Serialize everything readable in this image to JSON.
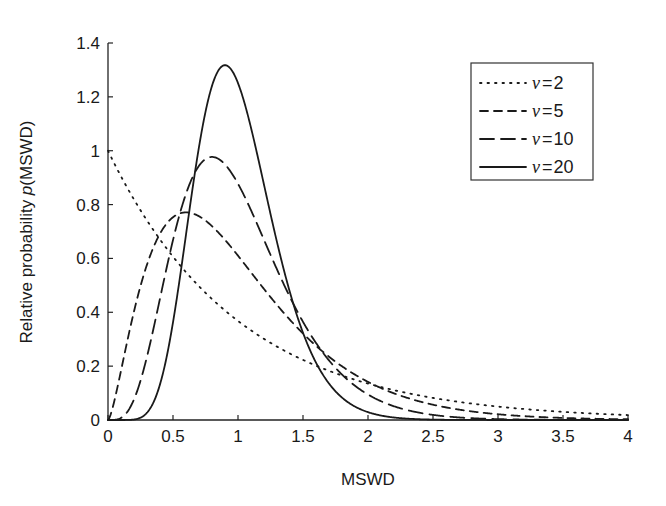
{
  "chart_data": {
    "type": "line",
    "title": "",
    "xlabel": "MSWD",
    "ylabel": "Relative probability p(MSWD)",
    "ylabel_parts": {
      "prefix": "Relative probability ",
      "italic": "p",
      "suffix": "(MSWD)"
    },
    "xlim": [
      0,
      4
    ],
    "ylim": [
      0,
      1.4
    ],
    "xticks": [
      "0",
      "0.5",
      "1",
      "1.5",
      "2",
      "2.5",
      "3",
      "3.5",
      "4"
    ],
    "yticks": [
      "0",
      "0.2",
      "0.4",
      "0.6",
      "0.8",
      "1",
      "1.2",
      "1.4"
    ],
    "grid": false,
    "legend_position": "upper right",
    "series": [
      {
        "name": "ν = 2",
        "nu": 2,
        "style": "dotted",
        "peak": {
          "x": 0.0,
          "y": 1.0
        }
      },
      {
        "name": "ν = 5",
        "nu": 5,
        "style": "dashed-short",
        "peak": {
          "x": 0.6,
          "y": 0.77
        }
      },
      {
        "name": "ν = 10",
        "nu": 10,
        "style": "dashed-long",
        "peak": {
          "x": 0.8,
          "y": 0.98
        }
      },
      {
        "name": "ν = 20",
        "nu": 20,
        "style": "solid",
        "peak": {
          "x": 0.9,
          "y": 1.32
        }
      }
    ],
    "sampled_values": {
      "x": [
        0,
        0.25,
        0.5,
        0.75,
        1.0,
        1.25,
        1.5,
        2.0,
        2.5,
        3.0,
        3.5,
        4.0
      ],
      "nu_2": [
        1.0,
        0.78,
        0.61,
        0.47,
        0.37,
        0.29,
        0.22,
        0.14,
        0.08,
        0.05,
        0.03,
        0.02
      ],
      "nu_5": [
        0.0,
        0.56,
        0.76,
        0.72,
        0.62,
        0.5,
        0.39,
        0.21,
        0.11,
        0.05,
        0.03,
        0.01
      ],
      "nu_10": [
        0.0,
        0.19,
        0.78,
        0.97,
        0.88,
        0.66,
        0.44,
        0.15,
        0.04,
        0.01,
        0.0,
        0.0
      ],
      "nu_20": [
        0.0,
        0.01,
        0.51,
        1.21,
        1.25,
        0.79,
        0.35,
        0.03,
        0.0,
        0.0,
        0.0,
        0.0
      ]
    }
  },
  "legend": {
    "items": [
      {
        "symbol": "ν",
        "value": "2"
      },
      {
        "symbol": "ν",
        "value": "5"
      },
      {
        "symbol": "ν",
        "value": "10"
      },
      {
        "symbol": "ν",
        "value": "20"
      }
    ]
  }
}
